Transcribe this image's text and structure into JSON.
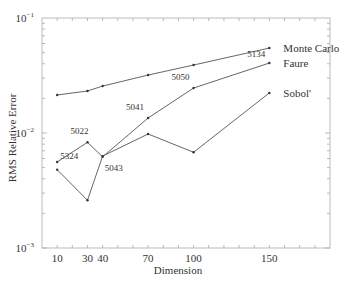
{
  "chart_data": {
    "type": "line",
    "title": "",
    "xlabel": "Dimension",
    "ylabel": "RMS Relative Error",
    "yscale": "log",
    "ylim": [
      0.001,
      0.1
    ],
    "xlim": [
      0,
      190
    ],
    "x": [
      10,
      30,
      40,
      70,
      100,
      150
    ],
    "xtick_labels": [
      "10",
      "30",
      "40",
      "70",
      "100",
      "150"
    ],
    "ytick_labels": [
      {
        "base": "10",
        "exp": "-1",
        "value": 0.1
      },
      {
        "base": "10",
        "exp": "-2",
        "value": 0.01
      },
      {
        "base": "10",
        "exp": "-3",
        "value": 0.001
      }
    ],
    "grid": false,
    "legend": "inline labels at line ends",
    "series": [
      {
        "name": "Monte Carlo",
        "values": [
          0.0214,
          0.0232,
          0.0256,
          0.0319,
          0.039,
          0.0548
        ]
      },
      {
        "name": "Faure",
        "values": [
          0.0056,
          0.0083,
          0.0062,
          0.0135,
          0.0246,
          0.0406
        ]
      },
      {
        "name": "Sobol'",
        "values": [
          0.0048,
          0.0026,
          0.0063,
          0.0098,
          0.0068,
          0.0223
        ]
      }
    ],
    "annotations": [
      {
        "text": "5324",
        "x": 10,
        "series": "Faure"
      },
      {
        "text": "5022",
        "x": 30,
        "series": "Faure"
      },
      {
        "text": "5043",
        "x": 40,
        "series": "Faure"
      },
      {
        "text": "5041",
        "x": 70,
        "series": "Faure"
      },
      {
        "text": "5050",
        "x": 100,
        "series": "Faure"
      },
      {
        "text": "5134",
        "x": 150,
        "series": "Faure"
      }
    ]
  }
}
